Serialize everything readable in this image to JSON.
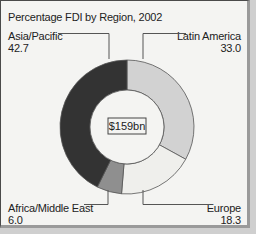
{
  "chart_data": {
    "type": "pie",
    "variant": "donut",
    "title": "Percentage FDI by Region, 2002",
    "center_label": "$159bn",
    "categories": [
      "Latin America",
      "Europe",
      "Africa/Middle East",
      "Asia/Pacific"
    ],
    "values": [
      33.0,
      18.3,
      6.0,
      42.7
    ],
    "value_labels": [
      "33.0",
      "18.3",
      "6.0",
      "42.7"
    ],
    "colors": [
      "#d2d2d2",
      "#efefec",
      "#8f8f8f",
      "#333333"
    ],
    "legend": "leader-line labels"
  }
}
